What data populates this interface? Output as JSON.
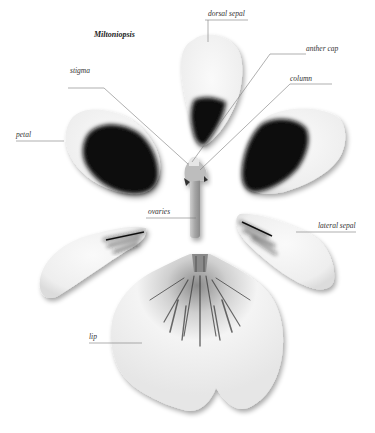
{
  "title": "Miltoniopsis",
  "labels": {
    "dorsal_sepal": "dorsal sepal",
    "anther_cap": "anther cap",
    "column": "column",
    "stigma": "stigma",
    "petal": "petal",
    "ovaries": "ovaries",
    "lateral_sepal": "lateral sepal",
    "lip": "lip"
  },
  "colors": {
    "background": "#ffffff",
    "petal_white": "#f2f2f2",
    "petal_dark": "#0d0d0d",
    "lip_mark": "#6a6a6a",
    "leader_line": "#7a7a7a"
  }
}
